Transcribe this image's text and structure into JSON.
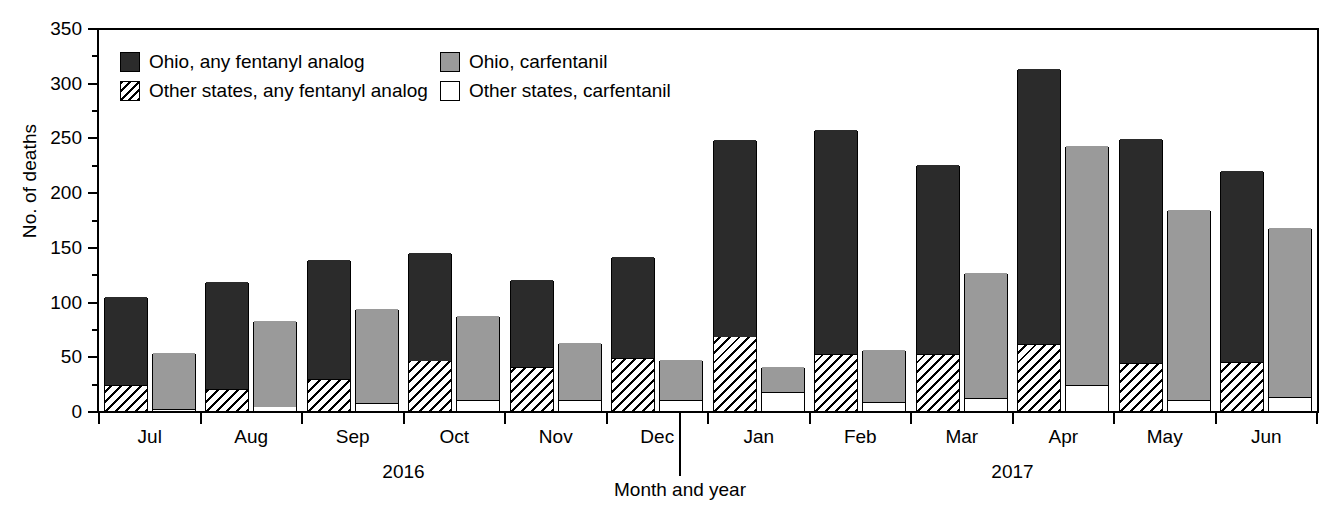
{
  "chart_data": {
    "type": "bar",
    "title": "",
    "xlabel": "Month and year",
    "ylabel": "No. of deaths",
    "ylim": [
      0,
      350
    ],
    "ytick_step": 50,
    "yminor_step": 25,
    "grid": false,
    "legend_position": "top-left-inside",
    "ytick_labels": [
      "350",
      "300",
      "250",
      "200",
      "150",
      "100",
      "50",
      "0"
    ],
    "categories": [
      "Jul",
      "Aug",
      "Sep",
      "Oct",
      "Nov",
      "Dec",
      "Jan",
      "Feb",
      "Mar",
      "Apr",
      "May",
      "Jun"
    ],
    "year_groups": [
      {
        "label": "2016",
        "months": [
          "Jul",
          "Aug",
          "Sep",
          "Oct",
          "Nov",
          "Dec"
        ]
      },
      {
        "label": "2017",
        "months": [
          "Jan",
          "Feb",
          "Mar",
          "Apr",
          "May",
          "Jun"
        ]
      }
    ],
    "series": [
      {
        "name": "Ohio, any fentanyl analog",
        "key": "ohio_analog",
        "style": "solid-dark",
        "color": "#2b2b2b",
        "values": [
          104,
          118,
          138,
          144,
          120,
          141,
          248,
          257,
          225,
          313,
          249,
          219
        ]
      },
      {
        "name": "Other states, any fentanyl analog",
        "key": "other_analog",
        "style": "hatched",
        "color": "#ffffff",
        "values": [
          24,
          20,
          29,
          46,
          40,
          48,
          68,
          52,
          52,
          61,
          44,
          45
        ]
      },
      {
        "name": "Ohio, carfentanil",
        "key": "ohio_carfentanil",
        "style": "solid-gray",
        "color": "#9a9a9a",
        "values": [
          53,
          82,
          93,
          87,
          62,
          47,
          40,
          56,
          126,
          242,
          184,
          167
        ]
      },
      {
        "name": "Other states, carfentanil",
        "key": "other_carfentanil",
        "style": "solid-white",
        "color": "#ffffff",
        "values": [
          2,
          4,
          7,
          10,
          10,
          10,
          17,
          8,
          12,
          24,
          10,
          13
        ]
      }
    ]
  },
  "legend": {
    "entries": [
      {
        "label": "Ohio, any fentanyl analog",
        "swatch": "solid-dark"
      },
      {
        "label": "Ohio, carfentanil",
        "swatch": "solid-gray"
      },
      {
        "label": "Other states, any fentanyl analog",
        "swatch": "hatched"
      },
      {
        "label": "Other states, carfentanil",
        "swatch": "solid-white"
      }
    ]
  },
  "axes": {
    "y_title": "No. of deaths",
    "x_title": "Month and year"
  }
}
